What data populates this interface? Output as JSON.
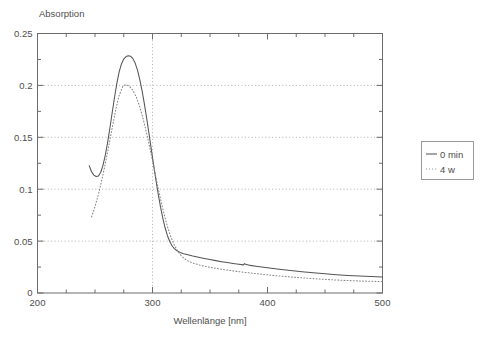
{
  "chart_data": {
    "type": "line",
    "title": "",
    "xlabel": "Wellenlänge  [nm]",
    "ylabel": "Absorption",
    "xlim": [
      200,
      500
    ],
    "ylim": [
      0,
      0.25
    ],
    "xticks": [
      200,
      300,
      400,
      500
    ],
    "xticklabels": [
      "200",
      "300",
      "400",
      "500"
    ],
    "xtick_minor_step": 25,
    "yticks": [
      0,
      0.05,
      0.1,
      0.15,
      0.2,
      0.25
    ],
    "yticklabels": [
      "0",
      "0.05",
      "0.1",
      "0.15",
      "0.2",
      "0.25"
    ],
    "ytick_minor_step": 0.025,
    "grid": "dotted horizontal at each major y, dotted vertical at x=300",
    "legend_position": "right-outside",
    "legend": [
      "0 min",
      "4 w"
    ],
    "series": [
      {
        "name": "0 min",
        "style": "solid",
        "color": "#545454",
        "points": [
          [
            245.0,
            0.1225
          ],
          [
            247.0,
            0.1168
          ],
          [
            249.0,
            0.1136
          ],
          [
            251.0,
            0.1122
          ],
          [
            253.0,
            0.1128
          ],
          [
            255.0,
            0.1163
          ],
          [
            257.0,
            0.1232
          ],
          [
            259.0,
            0.133
          ],
          [
            261.0,
            0.1452
          ],
          [
            263.0,
            0.1592
          ],
          [
            265.0,
            0.1741
          ],
          [
            267.0,
            0.1886
          ],
          [
            269.0,
            0.2019
          ],
          [
            271.0,
            0.213
          ],
          [
            273.0,
            0.2207
          ],
          [
            275.0,
            0.2254
          ],
          [
            277.0,
            0.2278
          ],
          [
            279.0,
            0.2285
          ],
          [
            281.0,
            0.228
          ],
          [
            283.0,
            0.2258
          ],
          [
            285.0,
            0.2213
          ],
          [
            287.0,
            0.2145
          ],
          [
            289.0,
            0.2054
          ],
          [
            291.0,
            0.1944
          ],
          [
            293.0,
            0.1818
          ],
          [
            295.0,
            0.1679
          ],
          [
            297.0,
            0.1532
          ],
          [
            299.0,
            0.1382
          ],
          [
            301.0,
            0.1232
          ],
          [
            303.0,
            0.1087
          ],
          [
            305.0,
            0.0951
          ],
          [
            307.0,
            0.0827
          ],
          [
            309.0,
            0.0718
          ],
          [
            311.0,
            0.0626
          ],
          [
            313.0,
            0.0552
          ],
          [
            315.0,
            0.0496
          ],
          [
            317.0,
            0.0455
          ],
          [
            319.0,
            0.0427
          ],
          [
            321.0,
            0.0409
          ],
          [
            324.0,
            0.0391
          ],
          [
            327.0,
            0.0379
          ],
          [
            330.0,
            0.037
          ],
          [
            335.0,
            0.0356
          ],
          [
            340.0,
            0.0344
          ],
          [
            345.0,
            0.0333
          ],
          [
            350.0,
            0.0322
          ],
          [
            355.0,
            0.0312
          ],
          [
            360.0,
            0.0302
          ],
          [
            365.0,
            0.0293
          ],
          [
            370.0,
            0.0285
          ],
          [
            375.0,
            0.0277
          ],
          [
            379.0,
            0.0271
          ],
          [
            380.0,
            0.0283
          ],
          [
            381.0,
            0.0276
          ],
          [
            385.0,
            0.0266
          ],
          [
            390.0,
            0.0258
          ],
          [
            400.0,
            0.0243
          ],
          [
            410.0,
            0.0229
          ],
          [
            420.0,
            0.0217
          ],
          [
            430.0,
            0.0205
          ],
          [
            440.0,
            0.0195
          ],
          [
            450.0,
            0.0185
          ],
          [
            460.0,
            0.0176
          ],
          [
            470.0,
            0.0169
          ],
          [
            480.0,
            0.0163
          ],
          [
            490.0,
            0.0158
          ],
          [
            500.0,
            0.0155
          ]
        ]
      },
      {
        "name": "4 w",
        "style": "dotted",
        "color": "#858585",
        "points": [
          [
            247.0,
            0.0733
          ],
          [
            250.0,
            0.0832
          ],
          [
            253.0,
            0.0951
          ],
          [
            256.0,
            0.1091
          ],
          [
            259.0,
            0.1248
          ],
          [
            262.0,
            0.1418
          ],
          [
            265.0,
            0.1594
          ],
          [
            268.0,
            0.1763
          ],
          [
            271.0,
            0.1905
          ],
          [
            274.0,
            0.1985
          ],
          [
            276.0,
            0.2005
          ],
          [
            278.0,
            0.2003
          ],
          [
            280.0,
            0.1991
          ],
          [
            283.0,
            0.1952
          ],
          [
            286.0,
            0.1884
          ],
          [
            289.0,
            0.179
          ],
          [
            292.0,
            0.1672
          ],
          [
            295.0,
            0.1534
          ],
          [
            298.0,
            0.1381
          ],
          [
            301.0,
            0.122
          ],
          [
            304.0,
            0.1058
          ],
          [
            307.0,
            0.0903
          ],
          [
            310.0,
            0.0762
          ],
          [
            313.0,
            0.064
          ],
          [
            316.0,
            0.054
          ],
          [
            319.0,
            0.0461
          ],
          [
            322.0,
            0.0402
          ],
          [
            325.0,
            0.0359
          ],
          [
            328.0,
            0.0329
          ],
          [
            331.0,
            0.0308
          ],
          [
            335.0,
            0.0289
          ],
          [
            340.0,
            0.0272
          ],
          [
            345.0,
            0.0259
          ],
          [
            350.0,
            0.0248
          ],
          [
            355.0,
            0.0238
          ],
          [
            360.0,
            0.0229
          ],
          [
            365.0,
            0.0221
          ],
          [
            370.0,
            0.0213
          ],
          [
            380.0,
            0.0199
          ],
          [
            390.0,
            0.0187
          ],
          [
            400.0,
            0.0175
          ],
          [
            410.0,
            0.0164
          ],
          [
            420.0,
            0.0154
          ],
          [
            430.0,
            0.0146
          ],
          [
            440.0,
            0.0138
          ],
          [
            450.0,
            0.0131
          ],
          [
            460.0,
            0.0125
          ],
          [
            470.0,
            0.012
          ],
          [
            480.0,
            0.0116
          ],
          [
            490.0,
            0.0113
          ],
          [
            500.0,
            0.011
          ]
        ]
      }
    ]
  }
}
